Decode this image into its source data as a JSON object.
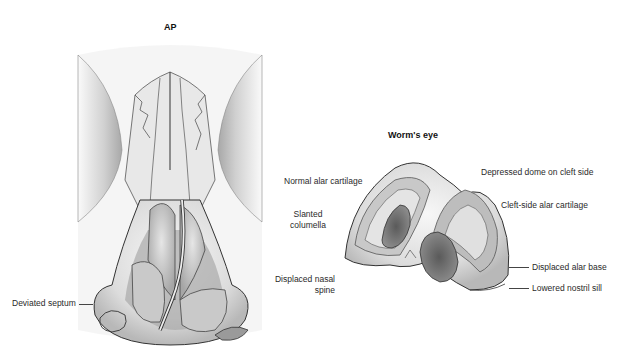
{
  "views": {
    "ap": {
      "title": "AP",
      "labels": {
        "deviated_septum": "Deviated septum"
      }
    },
    "worms_eye": {
      "title": "Worm's eye",
      "labels": {
        "normal_alar_cartilage": "Normal alar cartilage",
        "slanted_columella_1": "Slanted",
        "slanted_columella_2": "columella",
        "displaced_nasal_spine_1": "Displaced nasal",
        "displaced_nasal_spine_2": "spine",
        "depressed_dome": "Depressed dome on cleft side",
        "cleft_side_alar_cartilage": "Cleft-side alar cartilage",
        "displaced_alar_base": "Displaced alar base",
        "lowered_nostril_sill": "Lowered nostril sill"
      }
    }
  },
  "colors": {
    "outline": "#2b2b2b",
    "skin_light": "#f2f2f2",
    "skin_mid": "#d6d6d6",
    "skin_dark": "#9a9a9a",
    "nostril": "#6a6a6a"
  }
}
